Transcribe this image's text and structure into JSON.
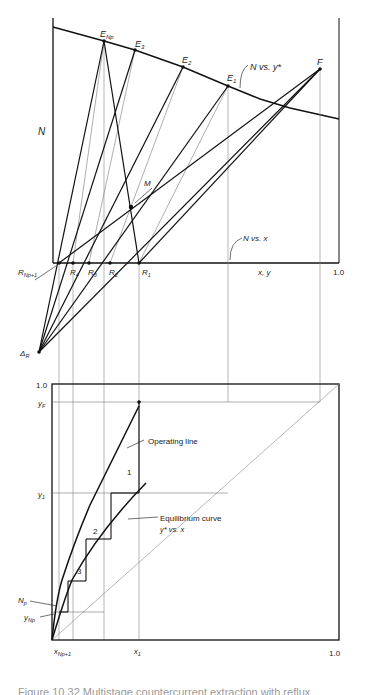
{
  "figure": {
    "caption": "Figure 10.32 Multistage countercurrent extraction with reflux",
    "upper_panel": {
      "y_axis_label": "N",
      "x_axis_label": "x, y",
      "x_max_label": "1.0",
      "curve_labels": {
        "extract": "N vs. y*",
        "raffinate": "N vs. x"
      },
      "points": {
        "ENp": "E",
        "ENp_sub": "Np",
        "E3": "E",
        "E3_sub": "3",
        "E2": "E",
        "E2_sub": "2",
        "E1": "E",
        "E1_sub": "1",
        "F": "F",
        "M": "M",
        "RNp1": "R",
        "RNp1_sub": "Np+1",
        "R4": "R",
        "R4_sub": "4",
        "R3": "R",
        "R3_sub": "3",
        "R2": "R",
        "R2_sub": "2",
        "R1": "R",
        "R1_sub": "1",
        "DeltaR": "Δ",
        "DeltaR_sub": "R"
      }
    },
    "lower_panel": {
      "y_top_label": "1.0",
      "yF": "y",
      "yF_sub": "F",
      "y1": "y",
      "y1_sub": "1",
      "Np": "N",
      "Np_sub": "p",
      "yNp": "y",
      "yNp_sub": "Np",
      "x_left": "x",
      "x_left_sub": "Np+1",
      "x1": "x",
      "x1_sub": "1",
      "x_max_label": "1.0",
      "operating_line_label": "Operating line",
      "equilibrium_label": "Equilibrium curve",
      "equilibrium_sub": "y* vs. x",
      "stages": [
        "1",
        "2",
        "3"
      ]
    }
  }
}
